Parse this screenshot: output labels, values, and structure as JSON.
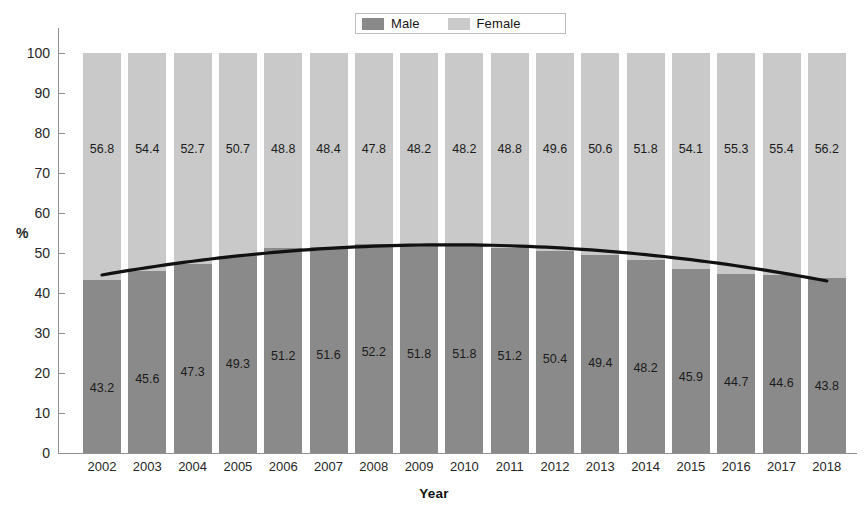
{
  "legend": {
    "items": [
      {
        "label": "Male",
        "color": "#8a8a8a"
      },
      {
        "label": "Female",
        "color": "#c9c9c9"
      }
    ]
  },
  "axes": {
    "ylabel": "%",
    "xlabel": "Year",
    "yticks": [
      "0",
      "10",
      "20",
      "30",
      "40",
      "50",
      "60",
      "70",
      "80",
      "90",
      "100"
    ]
  },
  "chart_data": {
    "type": "bar",
    "subtype": "stacked-percentage-with-trendline",
    "title": "",
    "subtitle": "",
    "xlabel": "Year",
    "ylabel": "%",
    "ylim": [
      0,
      100
    ],
    "ytick_step": 10,
    "grid": false,
    "legend_position": "top-center",
    "categories": [
      "2002",
      "2003",
      "2004",
      "2005",
      "2006",
      "2007",
      "2008",
      "2009",
      "2010",
      "2011",
      "2012",
      "2013",
      "2014",
      "2015",
      "2016",
      "2017",
      "2018"
    ],
    "series": [
      {
        "name": "Male",
        "color": "#8a8a8a",
        "values": [
          43.2,
          45.6,
          47.3,
          49.3,
          51.2,
          51.6,
          52.2,
          51.8,
          51.8,
          51.2,
          50.4,
          49.4,
          48.2,
          45.9,
          44.7,
          44.6,
          43.8
        ]
      },
      {
        "name": "Female",
        "color": "#c9c9c9",
        "values": [
          56.8,
          54.4,
          52.7,
          50.7,
          48.8,
          48.4,
          47.8,
          48.2,
          48.2,
          48.8,
          49.6,
          50.6,
          51.8,
          54.1,
          55.3,
          55.4,
          56.2
        ]
      }
    ],
    "trendline": {
      "name": "Male trend",
      "color": "#111111",
      "shape": "parabolic",
      "start_value": 44.5,
      "peak_value": 52.0,
      "peak_category": "2009",
      "end_value": 43.0
    }
  }
}
